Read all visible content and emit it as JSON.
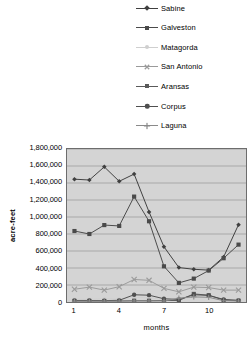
{
  "chart_data": {
    "type": "line",
    "title": "",
    "xlabel": "months",
    "ylabel": "acre-feet",
    "x": [
      1,
      2,
      3,
      4,
      5,
      6,
      7,
      8,
      9,
      10,
      11,
      12
    ],
    "categories": [
      "1",
      "2",
      "3",
      "4",
      "5",
      "6",
      "7",
      "8",
      "9",
      "10",
      "11",
      "12"
    ],
    "xtick_labels": [
      "1",
      "4",
      "7",
      "10"
    ],
    "xtick_values": [
      1,
      4,
      7,
      10
    ],
    "ylim": [
      0,
      1800000
    ],
    "ytick_labels": [
      "1,800,000",
      "1,600,000",
      "1,400,000",
      "1,200,000",
      "1,000,000",
      "800,000",
      "600,000",
      "400,000",
      "200,000",
      "0"
    ],
    "ytick_values": [
      1800000,
      1600000,
      1400000,
      1200000,
      1000000,
      800000,
      600000,
      400000,
      200000,
      0
    ],
    "grid": true,
    "grid_axis": "y",
    "legend_position": "top-right",
    "plot_background": "#d4d4d4",
    "series": [
      {
        "name": "Sabine",
        "marker": "diamond",
        "color": "#3f3f3f",
        "values": [
          1445000,
          1435000,
          1590000,
          1420000,
          1505000,
          1060000,
          650000,
          405000,
          385000,
          375000,
          530000,
          910000
        ]
      },
      {
        "name": "Galveston",
        "marker": "square",
        "color": "#4a4a4a",
        "values": [
          835000,
          800000,
          905000,
          895000,
          1240000,
          950000,
          420000,
          225000,
          275000,
          370000,
          515000,
          675000
        ]
      },
      {
        "name": "Matagorda",
        "marker": "dot",
        "color": "#cfcfcf",
        "values": [
          35000,
          30000,
          40000,
          35000,
          55000,
          50000,
          30000,
          30000,
          60000,
          55000,
          35000,
          25000
        ]
      },
      {
        "name": "San Antonio",
        "marker": "x",
        "color": "#9a9a9a",
        "values": [
          150000,
          175000,
          140000,
          180000,
          265000,
          255000,
          160000,
          120000,
          175000,
          170000,
          140000,
          140000
        ]
      },
      {
        "name": "Aransas",
        "marker": "square",
        "color": "#5a5a5a",
        "values": [
          12000,
          12000,
          12000,
          12000,
          15000,
          15000,
          18000,
          18000,
          95000,
          80000,
          22000,
          15000
        ]
      },
      {
        "name": "Corpus",
        "marker": "circle",
        "color": "#4f4f4f",
        "values": [
          18000,
          18000,
          16000,
          20000,
          85000,
          80000,
          38000,
          30000,
          85000,
          78000,
          30000,
          20000
        ]
      },
      {
        "name": "Laguna",
        "marker": "plus",
        "color": "#8a8a8a",
        "values": [
          10000,
          10000,
          10000,
          10000,
          12000,
          12000,
          12000,
          45000,
          60000,
          55000,
          15000,
          12000
        ]
      }
    ]
  },
  "legend": {
    "items": [
      {
        "label": "Sabine"
      },
      {
        "label": "Galveston"
      },
      {
        "label": "Matagorda"
      },
      {
        "label": "San Antonio"
      },
      {
        "label": "Aransas"
      },
      {
        "label": "Corpus"
      },
      {
        "label": "Laguna"
      }
    ]
  }
}
